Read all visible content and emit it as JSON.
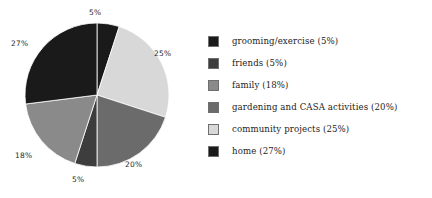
{
  "chart_data": {
    "type": "pie",
    "title": "",
    "legend_position": "right",
    "categories": [
      "grooming/exercise",
      "friends",
      "family",
      "gardening and CASA activities",
      "community projects",
      "home"
    ],
    "values": [
      5,
      5,
      18,
      20,
      25,
      27
    ],
    "value_unit": "%",
    "colors": [
      "#1a1a1a",
      "#3d3d3d",
      "#8a8a8a",
      "#6b6b6b",
      "#d8d8d8",
      "#1a1a1a"
    ],
    "legend_entries": [
      {
        "label": "grooming/exercise (5%)",
        "swatch": "#1a1a1a",
        "value": 5
      },
      {
        "label": "friends (5%)",
        "swatch": "#3d3d3d",
        "value": 5
      },
      {
        "label": "family (18%)",
        "swatch": "#8a8a8a",
        "value": 18
      },
      {
        "label": "gardening and CASA activities (20%)",
        "swatch": "#6b6b6b",
        "value": 20
      },
      {
        "label": "community projects (25%)",
        "swatch": "#d8d8d8",
        "value": 25
      },
      {
        "label": "home (27%)",
        "swatch": "#1a1a1a",
        "value": 27
      }
    ],
    "slices": [
      {
        "name": "grooming/exercise",
        "value": 5,
        "color": "#1a1a1a",
        "label": "5%",
        "start_deg": 0,
        "end_deg": 18
      },
      {
        "name": "community projects",
        "value": 25,
        "color": "#d8d8d8",
        "label": "25%",
        "start_deg": 18,
        "end_deg": 108
      },
      {
        "name": "gardening and CASA activities",
        "value": 20,
        "color": "#6b6b6b",
        "label": "20%",
        "start_deg": 108,
        "end_deg": 180
      },
      {
        "name": "friends",
        "value": 5,
        "color": "#3d3d3d",
        "label": "5%",
        "start_deg": 180,
        "end_deg": 198
      },
      {
        "name": "family",
        "value": 18,
        "color": "#8a8a8a",
        "label": "18%",
        "start_deg": 198,
        "end_deg": 262.8
      },
      {
        "name": "home",
        "value": 27,
        "color": "#1a1a1a",
        "label": "27%",
        "start_deg": 262.8,
        "end_deg": 360
      }
    ],
    "pie_labels": [
      {
        "text": "5%",
        "x": 89,
        "y": 9
      },
      {
        "text": "25%",
        "x": 154,
        "y": 50
      },
      {
        "text": "20%",
        "x": 125,
        "y": 161
      },
      {
        "text": "5%",
        "x": 72,
        "y": 176
      },
      {
        "text": "18%",
        "x": 15,
        "y": 152
      },
      {
        "text": "27%",
        "x": 11,
        "y": 40
      }
    ]
  }
}
